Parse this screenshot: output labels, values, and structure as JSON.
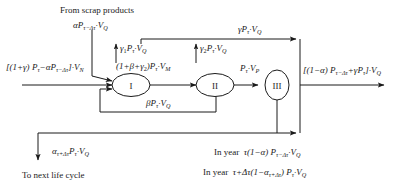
{
  "diagram": {
    "type": "flow-diagram",
    "nodes": [
      {
        "id": "I",
        "label": "I"
      },
      {
        "id": "II",
        "label": "II"
      },
      {
        "id": "III",
        "label": "III"
      }
    ],
    "text": {
      "from_scrap": "From scrap products",
      "to_next_life_cycle": "To next life cycle",
      "in_year_1_prefix": "In year",
      "in_year_2_prefix": "In year"
    },
    "labels": {
      "scrap_input": "αPτ−Δτ·VQ",
      "main_input": "[(1+γ) Pτ −αPτ−Δτ]·VN",
      "gamma1_out": "γ₁Pτ·VQ",
      "gamma2_out": "γ₂Pτ·VQ",
      "gamma_top": "γPτ·VQ",
      "node1_to_node2": "(1+β+γ₂)Pτ·VM",
      "node2_to_node3": "Pτ·VP",
      "beta_feedback": "βPτ·VQ",
      "right_output": "[(1−α) Pτ−Δτ+γPτ]·VQ",
      "next_cycle_flow": "ατ+ΔτPτ·VQ",
      "in_year_1": "τ(1−α) Pτ−Δτ·VQ",
      "in_year_2": "τ+Δτ(1−ατ+Δτ) Pτ·VQ"
    },
    "colors": {
      "background": "#ffffff",
      "stroke": "#1a1a1a",
      "text": "#1a1a1a"
    }
  }
}
